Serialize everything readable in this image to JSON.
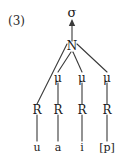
{
  "figure": {
    "example_number": "(3)",
    "line_color": "#3a3a3a",
    "text_color": "#1a1a1a",
    "background_color": "#ffffff"
  },
  "nodes": {
    "syllable": {
      "label": "σ",
      "x": 72,
      "y": 13
    },
    "nucleus": {
      "label": "N",
      "x": 72,
      "y": 46
    },
    "moras": [
      {
        "label": "μ",
        "x": 58,
        "y": 78
      },
      {
        "label": "μ",
        "x": 82,
        "y": 78
      },
      {
        "label": "μ",
        "x": 107,
        "y": 78
      }
    ],
    "roots": [
      {
        "label": "R",
        "x": 37,
        "y": 110
      },
      {
        "label": "R",
        "x": 58,
        "y": 110
      },
      {
        "label": "R",
        "x": 82,
        "y": 110
      },
      {
        "label": "R",
        "x": 107,
        "y": 110
      }
    ],
    "segments": [
      {
        "label": "u",
        "x": 37,
        "y": 148
      },
      {
        "label": "a",
        "x": 58,
        "y": 148
      },
      {
        "label": "i",
        "x": 82,
        "y": 148
      },
      {
        "label": "[p]",
        "x": 107,
        "y": 148
      }
    ]
  }
}
